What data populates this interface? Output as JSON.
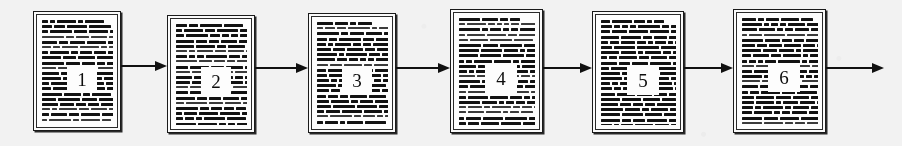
{
  "figure": {
    "kind": "document-processing-pipeline",
    "background_color": "#f3f2f0",
    "ink_color": "#111111",
    "paper_color": "#fdfdfb",
    "width": 902,
    "height": 146,
    "step_count": 6,
    "arrow_count": 6
  },
  "nodes": [
    {
      "label": "1",
      "name": "document-page-1",
      "x": 33,
      "y": 11,
      "w": 88,
      "h": 120,
      "plaque_x": 30,
      "plaque_y": 50,
      "plaque_w": 30,
      "plaque_h": 28
    },
    {
      "label": "2",
      "name": "document-page-2",
      "x": 167,
      "y": 15,
      "w": 88,
      "h": 118,
      "plaque_x": 30,
      "plaque_y": 48,
      "plaque_w": 30,
      "plaque_h": 28
    },
    {
      "label": "3",
      "name": "document-page-3",
      "x": 308,
      "y": 13,
      "w": 88,
      "h": 120,
      "plaque_x": 30,
      "plaque_y": 49,
      "plaque_w": 30,
      "plaque_h": 28
    },
    {
      "label": "4",
      "name": "document-page-4",
      "x": 450,
      "y": 9,
      "w": 93,
      "h": 124,
      "plaque_x": 31,
      "plaque_y": 51,
      "plaque_w": 32,
      "plaque_h": 29
    },
    {
      "label": "5",
      "name": "document-page-5",
      "x": 592,
      "y": 11,
      "w": 92,
      "h": 122,
      "plaque_x": 31,
      "plaque_y": 51,
      "plaque_w": 32,
      "plaque_h": 29
    },
    {
      "label": "6",
      "name": "document-page-6",
      "x": 733,
      "y": 9,
      "w": 93,
      "h": 124,
      "plaque_x": 31,
      "plaque_y": 50,
      "plaque_w": 32,
      "plaque_h": 29
    }
  ],
  "arrows": [
    {
      "name": "arrow-1-to-2",
      "x": 121,
      "y": 66,
      "w": 46
    },
    {
      "name": "arrow-2-to-3",
      "x": 255,
      "y": 68,
      "w": 53
    },
    {
      "name": "arrow-3-to-4",
      "x": 396,
      "y": 68,
      "w": 54
    },
    {
      "name": "arrow-4-to-5",
      "x": 543,
      "y": 68,
      "w": 49
    },
    {
      "name": "arrow-5-to-6",
      "x": 684,
      "y": 68,
      "w": 49
    },
    {
      "name": "arrow-6-to-output",
      "x": 826,
      "y": 68,
      "w": 58
    }
  ],
  "text_texture": {
    "description": "greeked body text rendered as short horizontal ink bars",
    "lines_per_page": 26,
    "bar_heights_px": [
      2,
      3
    ]
  }
}
